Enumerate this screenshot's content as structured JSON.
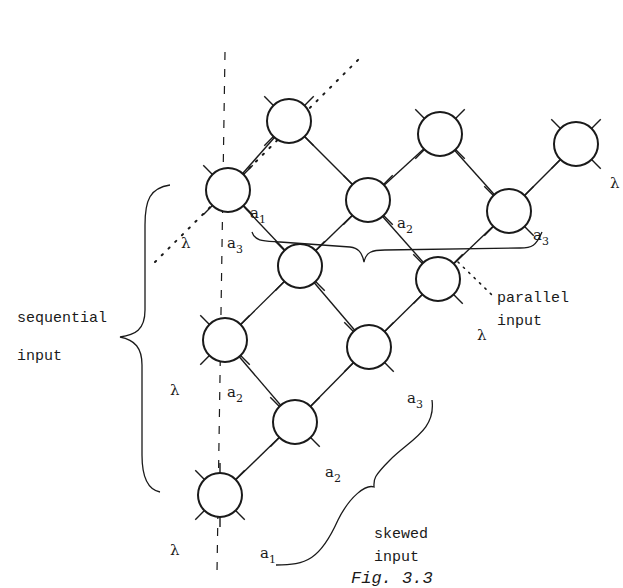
{
  "figure": {
    "caption": "Fig. 3.3",
    "colors": {
      "ink": "#1a1a1a",
      "background": "#ffffff"
    },
    "node_radius": 22,
    "nodes": [
      {
        "id": "n1",
        "x": 289,
        "y": 121
      },
      {
        "id": "n2",
        "x": 440,
        "y": 134
      },
      {
        "id": "n3",
        "x": 576,
        "y": 144
      },
      {
        "id": "n4",
        "x": 228,
        "y": 190
      },
      {
        "id": "n5",
        "x": 368,
        "y": 200
      },
      {
        "id": "n6",
        "x": 509,
        "y": 211
      },
      {
        "id": "n7",
        "x": 300,
        "y": 266
      },
      {
        "id": "n8",
        "x": 438,
        "y": 279
      },
      {
        "id": "n9",
        "x": 225,
        "y": 340
      },
      {
        "id": "n10",
        "x": 369,
        "y": 347
      },
      {
        "id": "n11",
        "x": 295,
        "y": 422
      },
      {
        "id": "n12",
        "x": 220,
        "y": 495
      }
    ],
    "edges": [
      [
        "n4",
        "n1"
      ],
      [
        "n1",
        "n5"
      ],
      [
        "n5",
        "n2"
      ],
      [
        "n2",
        "n6"
      ],
      [
        "n6",
        "n3"
      ],
      [
        "n4",
        "n7"
      ],
      [
        "n7",
        "n5"
      ],
      [
        "n5",
        "n8"
      ],
      [
        "n8",
        "n6"
      ],
      [
        "n9",
        "n7"
      ],
      [
        "n7",
        "n10"
      ],
      [
        "n10",
        "n8"
      ],
      [
        "n9",
        "n11"
      ],
      [
        "n11",
        "n10"
      ],
      [
        "n12",
        "n11"
      ]
    ],
    "labels": {
      "n4_a": {
        "base": "a",
        "sub": "1"
      },
      "n4_a3": {
        "base": "a",
        "sub": "3"
      },
      "n4_lambda": "λ",
      "n5_a": {
        "base": "a",
        "sub": "2"
      },
      "n6_a": {
        "base": "a",
        "sub": "3"
      },
      "n3_lambda": "λ",
      "n8_lambda": "λ",
      "n9_lambda": "λ",
      "n9_a": {
        "base": "a",
        "sub": "2"
      },
      "n10_a": {
        "base": "a",
        "sub": "3"
      },
      "n11_a": {
        "base": "a",
        "sub": "2"
      },
      "n12_lambda": "λ",
      "n12_a": {
        "base": "a",
        "sub": "1"
      }
    },
    "annotations": {
      "sequential_line1": "sequential",
      "sequential_line2": "input",
      "parallel_line1": "parallel",
      "parallel_line2": "input",
      "skewed_line1": "skewed",
      "skewed_line2": "input"
    }
  }
}
